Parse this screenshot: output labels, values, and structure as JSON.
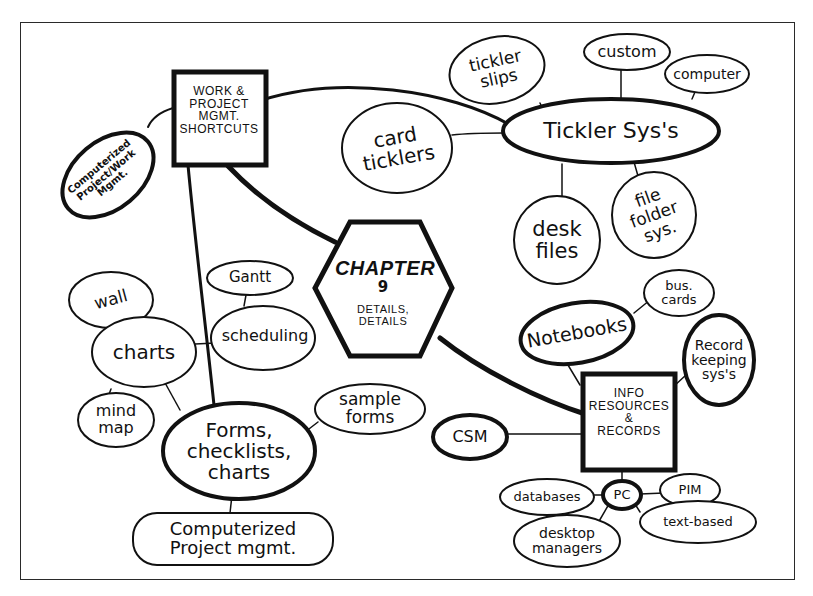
{
  "diagram": {
    "type": "mind-map",
    "center": {
      "id": "chapter",
      "title": "CHAPTER",
      "number": "9",
      "subtitle": "DETAILS,\nDETAILS"
    },
    "nodes": [
      {
        "id": "work",
        "label": "WORK &\nPROJECT\nMGMT.\nSHORTCUTS",
        "shape": "box"
      },
      {
        "id": "computerized_pw",
        "label": "Computerized\nProject/Work\nMgmt.",
        "shape": "ellipse"
      },
      {
        "id": "tickler",
        "label": "Tickler Sys's",
        "shape": "ellipse"
      },
      {
        "id": "tickler_slips",
        "label": "tickler\nslips",
        "shape": "ellipse"
      },
      {
        "id": "custom",
        "label": "custom",
        "shape": "ellipse"
      },
      {
        "id": "computer",
        "label": "computer",
        "shape": "ellipse"
      },
      {
        "id": "card_ticklers",
        "label": "card\nticklers",
        "shape": "ellipse"
      },
      {
        "id": "desk_files",
        "label": "desk\nfiles",
        "shape": "ellipse"
      },
      {
        "id": "file_folder",
        "label": "file\nfolder\nsys.",
        "shape": "ellipse"
      },
      {
        "id": "gantt",
        "label": "Gantt",
        "shape": "ellipse"
      },
      {
        "id": "scheduling",
        "label": "scheduling",
        "shape": "ellipse"
      },
      {
        "id": "wall",
        "label": "wall",
        "shape": "ellipse"
      },
      {
        "id": "charts",
        "label": "charts",
        "shape": "ellipse"
      },
      {
        "id": "mind_map",
        "label": "mind\nmap",
        "shape": "ellipse"
      },
      {
        "id": "forms",
        "label": "Forms,\nchecklists,\ncharts",
        "shape": "ellipse"
      },
      {
        "id": "sample_forms",
        "label": "sample\nforms",
        "shape": "ellipse"
      },
      {
        "id": "computerized_pm",
        "label": "Computerized\nProject mgmt.",
        "shape": "rounded"
      },
      {
        "id": "notebooks",
        "label": "Notebooks",
        "shape": "ellipse"
      },
      {
        "id": "bus_cards",
        "label": "bus.\ncards",
        "shape": "ellipse"
      },
      {
        "id": "record_keeping",
        "label": "Record\nkeeping\nsys's",
        "shape": "ellipse"
      },
      {
        "id": "info",
        "label": "INFO\nRESOURCES\n&\nRECORDS",
        "shape": "box"
      },
      {
        "id": "csm",
        "label": "CSM",
        "shape": "ellipse"
      },
      {
        "id": "pc",
        "label": "PC",
        "shape": "ellipse"
      },
      {
        "id": "databases",
        "label": "databases",
        "shape": "ellipse"
      },
      {
        "id": "pim",
        "label": "PIM",
        "shape": "ellipse"
      },
      {
        "id": "desktop_managers",
        "label": "desktop\nmanagers",
        "shape": "ellipse"
      },
      {
        "id": "text_based",
        "label": "text-based",
        "shape": "ellipse"
      }
    ],
    "edges": [
      [
        "chapter",
        "work"
      ],
      [
        "chapter",
        "info"
      ],
      [
        "work",
        "tickler"
      ],
      [
        "work",
        "computerized_pw"
      ],
      [
        "work",
        "forms"
      ],
      [
        "tickler",
        "tickler_slips"
      ],
      [
        "tickler",
        "custom"
      ],
      [
        "tickler",
        "computer"
      ],
      [
        "tickler",
        "card_ticklers"
      ],
      [
        "tickler",
        "desk_files"
      ],
      [
        "tickler",
        "file_folder"
      ],
      [
        "scheduling",
        "gantt"
      ],
      [
        "scheduling",
        "charts"
      ],
      [
        "charts",
        "wall"
      ],
      [
        "charts",
        "mind_map"
      ],
      [
        "charts",
        "forms"
      ],
      [
        "forms",
        "sample_forms"
      ],
      [
        "forms",
        "computerized_pm"
      ],
      [
        "info",
        "notebooks"
      ],
      [
        "notebooks",
        "bus_cards"
      ],
      [
        "info",
        "record_keeping"
      ],
      [
        "info",
        "csm"
      ],
      [
        "info",
        "pc"
      ],
      [
        "pc",
        "databases"
      ],
      [
        "pc",
        "pim"
      ],
      [
        "pc",
        "desktop_managers"
      ],
      [
        "pc",
        "text_based"
      ]
    ]
  }
}
